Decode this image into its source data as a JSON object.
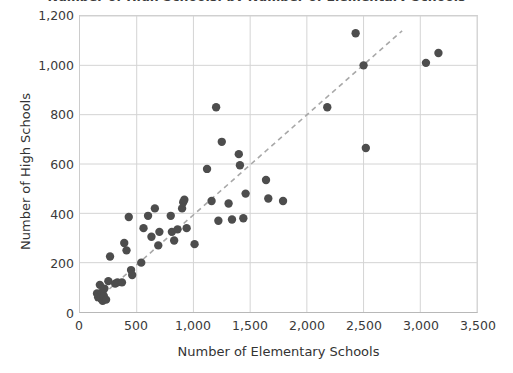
{
  "chart_data": {
    "type": "scatter",
    "title": "Number of High Schools, by Number of Elementary Schools",
    "xlabel": "Number of Elementary Schools",
    "ylabel": "Number of High Schools",
    "xlim": [
      0,
      3500
    ],
    "ylim": [
      0,
      1200
    ],
    "xticks": [
      0,
      500,
      1000,
      1500,
      2000,
      2500,
      3000,
      3500
    ],
    "xtick_labels": [
      "0",
      "500",
      "1,000",
      "1,500",
      "2,000",
      "2,500",
      "3,000",
      "3,500"
    ],
    "yticks": [
      0,
      200,
      400,
      600,
      800,
      1000,
      1200
    ],
    "ytick_labels": [
      "0",
      "200",
      "400",
      "600",
      "800",
      "1,000",
      "1,200"
    ],
    "grid": true,
    "legend": "none",
    "marker_color": "#4d4d4d",
    "grid_color": "#d4d4d4",
    "trendline": {
      "style": "dashed",
      "color": "#a8a8a8",
      "x_start": 140,
      "y_start": 45,
      "x_end": 2840,
      "y_end": 1140
    },
    "points": [
      {
        "x": 150,
        "y": 75
      },
      {
        "x": 160,
        "y": 60
      },
      {
        "x": 175,
        "y": 110
      },
      {
        "x": 185,
        "y": 55
      },
      {
        "x": 195,
        "y": 80
      },
      {
        "x": 200,
        "y": 45
      },
      {
        "x": 210,
        "y": 65
      },
      {
        "x": 215,
        "y": 95
      },
      {
        "x": 230,
        "y": 50
      },
      {
        "x": 250,
        "y": 125
      },
      {
        "x": 265,
        "y": 225
      },
      {
        "x": 310,
        "y": 115
      },
      {
        "x": 330,
        "y": 120
      },
      {
        "x": 370,
        "y": 120
      },
      {
        "x": 390,
        "y": 280
      },
      {
        "x": 410,
        "y": 250
      },
      {
        "x": 430,
        "y": 385
      },
      {
        "x": 450,
        "y": 170
      },
      {
        "x": 460,
        "y": 150
      },
      {
        "x": 540,
        "y": 200
      },
      {
        "x": 560,
        "y": 340
      },
      {
        "x": 600,
        "y": 390
      },
      {
        "x": 630,
        "y": 305
      },
      {
        "x": 660,
        "y": 420
      },
      {
        "x": 690,
        "y": 270
      },
      {
        "x": 700,
        "y": 325
      },
      {
        "x": 800,
        "y": 390
      },
      {
        "x": 810,
        "y": 325
      },
      {
        "x": 830,
        "y": 290
      },
      {
        "x": 860,
        "y": 335
      },
      {
        "x": 900,
        "y": 420
      },
      {
        "x": 910,
        "y": 445
      },
      {
        "x": 920,
        "y": 455
      },
      {
        "x": 940,
        "y": 340
      },
      {
        "x": 1010,
        "y": 275
      },
      {
        "x": 1120,
        "y": 580
      },
      {
        "x": 1160,
        "y": 450
      },
      {
        "x": 1200,
        "y": 830
      },
      {
        "x": 1220,
        "y": 370
      },
      {
        "x": 1250,
        "y": 690
      },
      {
        "x": 1310,
        "y": 440
      },
      {
        "x": 1340,
        "y": 375
      },
      {
        "x": 1400,
        "y": 640
      },
      {
        "x": 1410,
        "y": 595
      },
      {
        "x": 1440,
        "y": 380
      },
      {
        "x": 1460,
        "y": 480
      },
      {
        "x": 1640,
        "y": 535
      },
      {
        "x": 1660,
        "y": 460
      },
      {
        "x": 1790,
        "y": 450
      },
      {
        "x": 2180,
        "y": 830
      },
      {
        "x": 2430,
        "y": 1130
      },
      {
        "x": 2500,
        "y": 1000
      },
      {
        "x": 2520,
        "y": 665
      },
      {
        "x": 3050,
        "y": 1010
      },
      {
        "x": 3160,
        "y": 1050
      }
    ]
  }
}
